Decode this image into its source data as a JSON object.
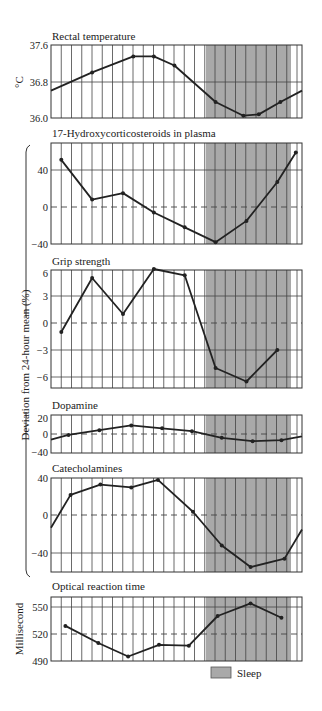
{
  "figure": {
    "shared_ylabel": "Deviation from 24-hour mean (%)",
    "legend": {
      "label": "Sleep",
      "color": "#a9a9a9"
    },
    "colors": {
      "sleep_shade": "#a9a9a9",
      "line": "#222222",
      "grid": "#333333",
      "background": "#ffffff"
    }
  },
  "chart_data": [
    {
      "type": "line",
      "title": "Rectal temperature",
      "ylabel": "°C",
      "ylim": [
        36.0,
        37.6
      ],
      "yticks": [
        "37.6",
        "36.8",
        "36.0"
      ],
      "x": [
        0,
        4,
        8,
        10,
        12,
        16,
        18.7,
        20.2,
        22.3,
        24.4
      ],
      "values": [
        36.6,
        37.0,
        37.35,
        37.35,
        37.15,
        36.35,
        36.05,
        36.08,
        36.35,
        36.6
      ],
      "dashed_zero": false,
      "sleep_shaded": true
    },
    {
      "type": "line",
      "title": "17-Hydroxycorticosteroids in plasma",
      "ylabel": "Deviation from 24-hour mean (%)",
      "ylim": [
        -40,
        70
      ],
      "yticks": [
        "40",
        "0",
        "−40"
      ],
      "x": [
        1,
        4,
        7,
        10,
        13,
        16,
        19,
        22,
        23.8
      ],
      "values": [
        51,
        8,
        15,
        -6,
        -22,
        -38,
        -15,
        27,
        59
      ],
      "dashed_zero": true,
      "sleep_shaded": true
    },
    {
      "type": "line",
      "title": "Grip strength",
      "ylabel": "Deviation from 24-hour mean (%)",
      "ylim": [
        -7,
        6
      ],
      "yticks": [
        "6",
        "3",
        "0",
        "−3",
        "−6"
      ],
      "x": [
        1,
        4,
        7,
        10,
        13,
        16,
        19,
        22
      ],
      "values": [
        -1,
        5,
        1,
        6,
        5.3,
        -5,
        -6.5,
        -3
      ],
      "dashed_zero": true,
      "sleep_shaded": true
    },
    {
      "type": "line",
      "title": "Dopamine",
      "ylabel": "Deviation from 24-hour mean (%)",
      "ylim": [
        -40,
        20
      ],
      "yticks": [
        "20",
        "0",
        "−40"
      ],
      "x": [
        0,
        1.7,
        4.7,
        7.8,
        10.8,
        13.7,
        16.6,
        19.6,
        22.4,
        24.4
      ],
      "values": [
        -12,
        -2,
        4,
        9,
        6,
        3,
        -8,
        -15,
        -13,
        -5
      ],
      "dashed_zero": true,
      "sleep_shaded": true
    },
    {
      "type": "line",
      "title": "Catecholamines",
      "ylabel": "Deviation from 24-hour mean (%)",
      "ylim": [
        -60,
        40
      ],
      "yticks": [
        "40",
        "0",
        "−40"
      ],
      "x": [
        0,
        1.9,
        4.8,
        7.8,
        10.4,
        13.8,
        16.6,
        19.4,
        22.7,
        24.4
      ],
      "values": [
        -13,
        22,
        33,
        30,
        38,
        4,
        -32,
        -55,
        -46,
        -15
      ],
      "dashed_zero": true,
      "sleep_shaded": true
    },
    {
      "type": "line",
      "title": "Optical reaction time",
      "ylabel": "Millisecond",
      "ylim": [
        490,
        561
      ],
      "yticks": [
        "550",
        "520",
        "490"
      ],
      "x": [
        1.4,
        4.6,
        7.5,
        10.5,
        13.4,
        16.2,
        19.4,
        22.4
      ],
      "values": [
        529,
        510,
        495,
        508,
        507,
        540,
        554,
        538
      ],
      "dashed_zero": false,
      "dashed_ref": 520,
      "sleep_shaded": true
    }
  ]
}
